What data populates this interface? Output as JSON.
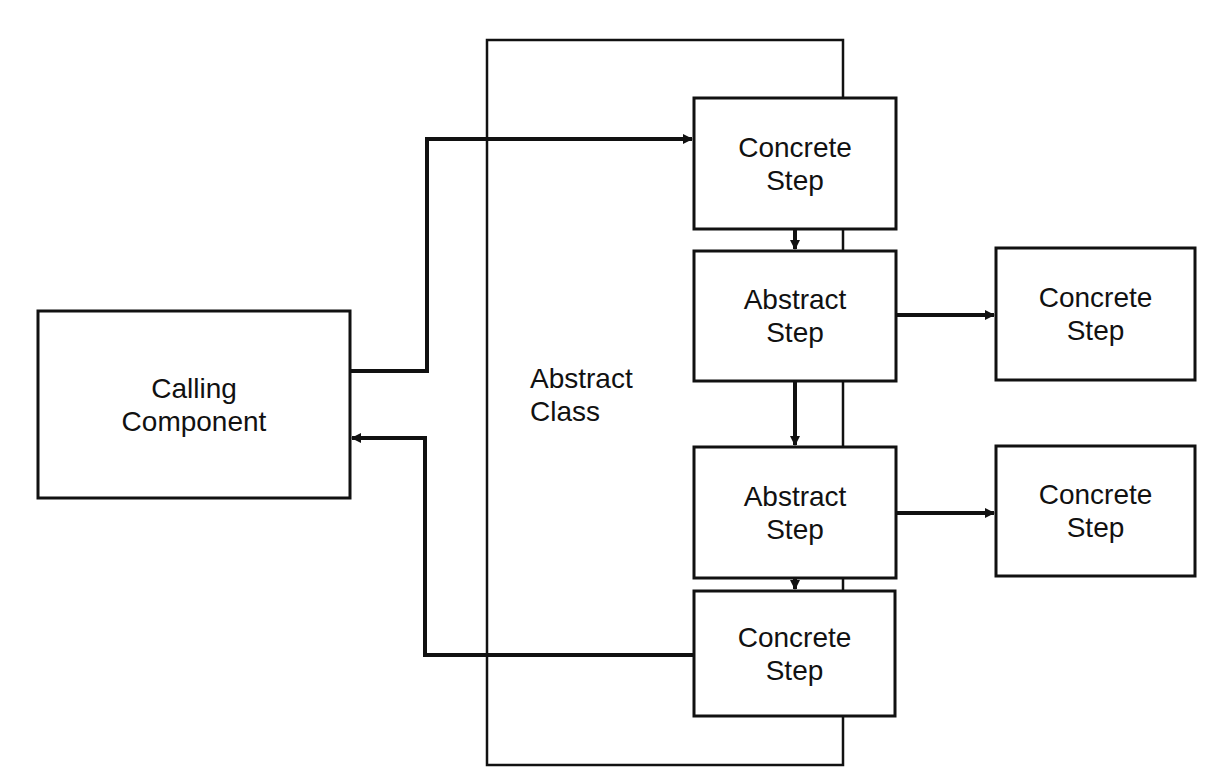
{
  "diagram": {
    "container": {
      "label_line1": "Abstract",
      "label_line2": "Class"
    },
    "calling_component": {
      "label_line1": "Calling",
      "label_line2": "Component"
    },
    "steps": [
      {
        "id": "step1",
        "line1": "Concrete",
        "line2": "Step",
        "kind": "concrete"
      },
      {
        "id": "step2",
        "line1": "Abstract",
        "line2": "Step",
        "kind": "abstract"
      },
      {
        "id": "step3",
        "line1": "Abstract",
        "line2": "Step",
        "kind": "abstract"
      },
      {
        "id": "step4",
        "line1": "Concrete",
        "line2": "Step",
        "kind": "concrete"
      }
    ],
    "implementations": [
      {
        "id": "impl2",
        "line1": "Concrete",
        "line2": "Step",
        "for": "step2"
      },
      {
        "id": "impl3",
        "line1": "Concrete",
        "line2": "Step",
        "for": "step3"
      }
    ],
    "edges": [
      {
        "from": "calling_component",
        "to": "step1",
        "type": "call"
      },
      {
        "from": "step1",
        "to": "step2"
      },
      {
        "from": "step2",
        "to": "step3"
      },
      {
        "from": "step3",
        "to": "step4"
      },
      {
        "from": "step2",
        "to": "impl2"
      },
      {
        "from": "step3",
        "to": "impl3"
      },
      {
        "from": "step4",
        "to": "calling_component",
        "type": "return"
      }
    ],
    "colors": {
      "stroke": "#111111",
      "background": "#ffffff"
    }
  }
}
